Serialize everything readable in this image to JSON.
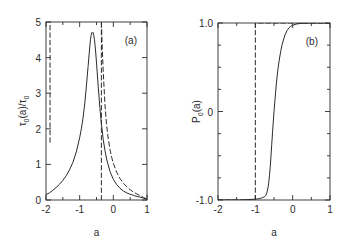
{
  "figure": {
    "background": "#ffffff",
    "ink": "#2b2b2b",
    "panel_count": 2
  },
  "chart_data": [
    {
      "type": "line",
      "panel_label": "(a)",
      "title": "",
      "xlabel": "a",
      "ylabel": "τ₀(a)/τ₀",
      "ylabel_parts": {
        "tau": "τ",
        "sub": "0",
        "arg": "(a)/",
        "tau2": "τ",
        "sub2": "0"
      },
      "xlim": [
        -2,
        1
      ],
      "ylim": [
        0,
        5
      ],
      "xticks": [
        -2,
        -1.5,
        -1,
        -0.5,
        0,
        0.5,
        1
      ],
      "xticklabels": [
        "-2",
        "",
        "-1",
        "",
        "0",
        "",
        "1"
      ],
      "yticks": [
        0,
        1,
        2,
        3,
        4,
        5
      ],
      "yticklabels": [
        "0",
        "1",
        "2",
        "3",
        "4",
        "5"
      ],
      "grid": false,
      "legend": "none",
      "series": [
        {
          "name": "solid",
          "style": "solid",
          "x": [
            -2.0,
            -1.9,
            -1.8,
            -1.7,
            -1.6,
            -1.5,
            -1.4,
            -1.3,
            -1.2,
            -1.1,
            -1.0,
            -0.95,
            -0.9,
            -0.85,
            -0.8,
            -0.75,
            -0.7,
            -0.68,
            -0.66,
            -0.64,
            -0.62,
            -0.6,
            -0.58,
            -0.56,
            -0.54,
            -0.52,
            -0.5,
            -0.45,
            -0.4,
            -0.35,
            -0.3,
            -0.25,
            -0.2,
            -0.1,
            0.0,
            0.1,
            0.2,
            0.3,
            0.4,
            0.5,
            0.6,
            0.7,
            0.8,
            0.9,
            1.0
          ],
          "y": [
            0.15,
            0.2,
            0.27,
            0.35,
            0.44,
            0.55,
            0.68,
            0.85,
            1.06,
            1.35,
            1.75,
            2.0,
            2.3,
            2.7,
            3.2,
            3.75,
            4.3,
            4.5,
            4.62,
            4.7,
            4.72,
            4.7,
            4.62,
            4.5,
            4.32,
            4.1,
            3.85,
            3.2,
            2.6,
            2.1,
            1.7,
            1.4,
            1.15,
            0.8,
            0.58,
            0.43,
            0.33,
            0.25,
            0.2,
            0.16,
            0.13,
            0.1,
            0.08,
            0.05,
            0.02
          ]
        },
        {
          "name": "dashed-left-asymptote",
          "style": "dashed",
          "x": [
            -1.88,
            -1.88
          ],
          "y": [
            1.62,
            5.0
          ]
        },
        {
          "name": "dashed-right-asymptote",
          "style": "dashed",
          "x": [
            -0.355,
            -0.355
          ],
          "y": [
            0.0,
            5.0
          ]
        },
        {
          "name": "dashed-divergent-branch",
          "style": "dashed",
          "x": [
            -0.355,
            -0.33,
            -0.3,
            -0.25,
            -0.2,
            -0.15,
            -0.1,
            -0.05,
            0.0,
            0.1,
            0.2,
            0.3,
            0.4,
            0.5,
            0.6,
            0.7,
            0.8,
            0.9,
            1.0
          ],
          "y": [
            5.0,
            4.3,
            3.6,
            2.7,
            2.1,
            1.72,
            1.42,
            1.2,
            1.03,
            0.78,
            0.6,
            0.47,
            0.37,
            0.29,
            0.22,
            0.17,
            0.12,
            0.07,
            0.02
          ]
        }
      ]
    },
    {
      "type": "line",
      "panel_label": "(b)",
      "title": "",
      "xlabel": "a",
      "ylabel": "P₀(a)",
      "ylabel_parts": {
        "p": "P",
        "sub": "0",
        "arg": "(a)"
      },
      "xlim": [
        -2,
        1
      ],
      "ylim": [
        -1.0,
        1.0
      ],
      "xticks": [
        -2,
        -1.5,
        -1,
        -0.5,
        0,
        0.5,
        1
      ],
      "xticklabels": [
        "-2",
        "",
        "-1",
        "",
        "0",
        "",
        "1"
      ],
      "yticks": [
        -1.0,
        -0.75,
        -0.5,
        -0.25,
        0,
        0.25,
        0.5,
        0.75,
        1.0
      ],
      "yticklabels": [
        "-1.0",
        "",
        "",
        "",
        "0",
        "",
        "",
        "",
        "1.0"
      ],
      "grid": false,
      "legend": "none",
      "series": [
        {
          "name": "solid",
          "style": "solid",
          "x": [
            -2.0,
            -1.8,
            -1.6,
            -1.4,
            -1.2,
            -1.1,
            -1.0,
            -0.95,
            -0.9,
            -0.85,
            -0.8,
            -0.75,
            -0.72,
            -0.7,
            -0.68,
            -0.66,
            -0.64,
            -0.62,
            -0.6,
            -0.58,
            -0.56,
            -0.54,
            -0.52,
            -0.5,
            -0.47,
            -0.44,
            -0.4,
            -0.36,
            -0.32,
            -0.28,
            -0.24,
            -0.2,
            -0.15,
            -0.1,
            -0.05,
            0.0,
            0.1,
            0.2,
            0.3,
            0.45,
            0.6,
            0.8,
            1.0
          ],
          "y": [
            -1.0,
            -1.0,
            -1.0,
            -1.0,
            -0.995,
            -0.993,
            -0.99,
            -0.988,
            -0.985,
            -0.98,
            -0.972,
            -0.96,
            -0.95,
            -0.93,
            -0.9,
            -0.86,
            -0.8,
            -0.72,
            -0.62,
            -0.5,
            -0.37,
            -0.24,
            -0.12,
            0.0,
            0.15,
            0.3,
            0.46,
            0.58,
            0.68,
            0.76,
            0.82,
            0.87,
            0.915,
            0.945,
            0.963,
            0.975,
            0.988,
            0.994,
            0.997,
            0.999,
            1.0,
            1.0,
            1.0
          ]
        },
        {
          "name": "dashed-step",
          "style": "dashed",
          "x": [
            -2.0,
            -1.0,
            -1.0,
            1.0
          ],
          "y": [
            -1.0,
            -1.0,
            1.0,
            1.0
          ]
        }
      ]
    }
  ]
}
